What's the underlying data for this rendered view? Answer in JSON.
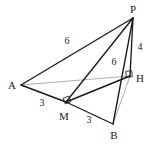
{
  "figure": {
    "width": 153,
    "height": 145,
    "background_color": "#ffffff",
    "stroke_color": "#1a1a1a",
    "faint_stroke_color": "#9a9a9a",
    "label_color": "#1a1a1a",
    "points": {
      "P": {
        "label": "P",
        "x": 133,
        "y": 18,
        "label_x": 133,
        "label_y": 9
      },
      "A": {
        "label": "A",
        "x": 21,
        "y": 85,
        "label_x": 12,
        "label_y": 85
      },
      "M": {
        "label": "M",
        "x": 66,
        "y": 102,
        "label_x": 64,
        "label_y": 116
      },
      "B": {
        "label": "B",
        "x": 113,
        "y": 124,
        "label_x": 114,
        "label_y": 135
      },
      "H": {
        "label": "H",
        "x": 130,
        "y": 76,
        "label_x": 140,
        "label_y": 78
      }
    },
    "edges": [
      {
        "name": "edge-A-P",
        "from": "A",
        "to": "P",
        "style": "solid-dark"
      },
      {
        "name": "edge-A-M",
        "from": "A",
        "to": "M",
        "style": "solid-dark"
      },
      {
        "name": "edge-M-B",
        "from": "M",
        "to": "B",
        "style": "solid-dark"
      },
      {
        "name": "edge-P-B",
        "from": "P",
        "to": "B",
        "style": "solid-dark"
      },
      {
        "name": "edge-P-M",
        "from": "P",
        "to": "M",
        "style": "solid-dark"
      },
      {
        "name": "edge-P-H",
        "from": "P",
        "to": "H",
        "style": "solid-dark"
      },
      {
        "name": "edge-M-H",
        "from": "M",
        "to": "H",
        "style": "solid-dark"
      },
      {
        "name": "edge-A-H",
        "from": "A",
        "to": "H",
        "style": "solid-faint"
      },
      {
        "name": "edge-B-H",
        "from": "B",
        "to": "H",
        "style": "solid-faint"
      }
    ],
    "measures": [
      {
        "name": "length-AP",
        "text": "6",
        "x": 67,
        "y": 41,
        "edge": "edge-A-P"
      },
      {
        "name": "length-PH",
        "text": "4",
        "x": 140,
        "y": 47,
        "edge": "edge-P-H"
      },
      {
        "name": "length-PM",
        "text": "6",
        "x": 114,
        "y": 62,
        "edge": "edge-P-M"
      },
      {
        "name": "length-AM",
        "text": "3",
        "x": 42,
        "y": 103,
        "edge": "edge-A-M"
      },
      {
        "name": "length-MB",
        "text": "3",
        "x": 89,
        "y": 120,
        "edge": "edge-M-B"
      }
    ],
    "right_angles": [
      {
        "name": "right-angle-at-M",
        "x": 64,
        "y": 97,
        "rotation": -22,
        "size": 6
      },
      {
        "name": "right-angle-at-H",
        "x": 126,
        "y": 71,
        "rotation": -6,
        "size": 6
      }
    ]
  }
}
